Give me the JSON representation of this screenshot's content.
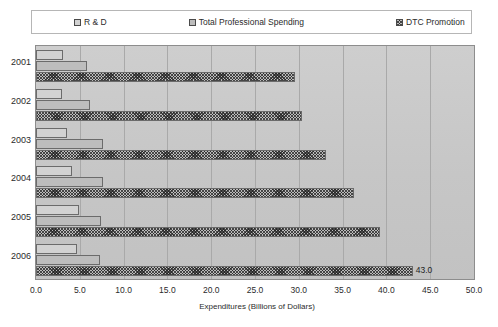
{
  "chart_data": {
    "type": "bar",
    "orientation": "horizontal",
    "title": "",
    "subtitle": "",
    "xlabel": "Expenditures (Billions of Dollars)",
    "ylabel": "",
    "xlim": [
      0.0,
      50.0
    ],
    "xticks": [
      "0.0",
      "5.0",
      "10.0",
      "15.0",
      "20.0",
      "25.0",
      "30.0",
      "35.0",
      "40.0",
      "45.0",
      "50.0"
    ],
    "xtick_values": [
      0,
      5,
      10,
      15,
      20,
      25,
      30,
      35,
      40,
      45,
      50
    ],
    "grid": true,
    "grid_axis": "x",
    "legend_position": "top",
    "categories": [
      "2001",
      "2002",
      "2003",
      "2004",
      "2005",
      "2006"
    ],
    "series": [
      {
        "name": "R & D",
        "swatch": "sw-rd",
        "values": [
          3.1,
          3.0,
          3.5,
          4.1,
          4.9,
          4.7
        ],
        "labels": [
          "",
          "",
          "",
          "",
          "",
          ""
        ]
      },
      {
        "name": "Total Professional Spending",
        "swatch": "sw-tps",
        "values": [
          5.8,
          6.2,
          7.7,
          7.7,
          7.4,
          7.3
        ],
        "labels": [
          "",
          "",
          "",
          "",
          "",
          ""
        ]
      },
      {
        "name": "DTC Promotion",
        "swatch": "sw-dtc",
        "values": [
          29.6,
          30.4,
          33.1,
          36.3,
          39.3,
          43.0
        ],
        "labels": [
          "",
          "",
          "",
          "",
          "",
          "43.0"
        ]
      }
    ],
    "annotations": [
      {
        "text": "43.0",
        "category": "2006",
        "series": "DTC Promotion",
        "value": 43.0
      }
    ],
    "colors": {
      "plot_background": "#c9c9c9",
      "legend_background": "#ffffff",
      "frame_border": "#8d8d8d",
      "gridline": "#a9a9a9",
      "bar_outline": "#6b6b6b",
      "text": "#2b2b2b"
    }
  },
  "legend": {
    "items": [
      {
        "label": "R & D"
      },
      {
        "label": "Total Professional Spending"
      },
      {
        "label": "DTC Promotion"
      }
    ]
  },
  "axis": {
    "x_title": "Expenditures (Billions of Dollars)"
  }
}
